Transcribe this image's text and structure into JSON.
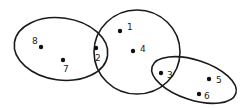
{
  "diagram": {
    "type": "set-clusters",
    "colors": {
      "stroke": "#1a1a1a",
      "dot": "#111111",
      "text": "#222222",
      "background": "#ffffff"
    },
    "sets": [
      {
        "id": "left",
        "cx": 61,
        "cy": 49,
        "rx": 47,
        "ry": 31,
        "rotate": 8,
        "members": [
          "8",
          "7",
          "2"
        ]
      },
      {
        "id": "middle",
        "cx": 137,
        "cy": 52,
        "rx": 43,
        "ry": 42,
        "rotate": 0,
        "members": [
          "2",
          "1",
          "4",
          "3"
        ]
      },
      {
        "id": "right",
        "cx": 194,
        "cy": 80,
        "rx": 44,
        "ry": 20,
        "rotate": 18,
        "members": [
          "3",
          "5",
          "6"
        ]
      }
    ],
    "points": [
      {
        "label": "8",
        "x": 41,
        "y": 47,
        "lx": 32,
        "ly": 44
      },
      {
        "label": "7",
        "x": 63,
        "y": 60,
        "lx": 63,
        "ly": 72
      },
      {
        "label": "2",
        "x": 96,
        "y": 48,
        "lx": 95,
        "ly": 61
      },
      {
        "label": "1",
        "x": 120,
        "y": 31,
        "lx": 127,
        "ly": 30
      },
      {
        "label": "4",
        "x": 133,
        "y": 51,
        "lx": 140,
        "ly": 52
      },
      {
        "label": "3",
        "x": 161,
        "y": 73,
        "lx": 167,
        "ly": 78
      },
      {
        "label": "5",
        "x": 209,
        "y": 79,
        "lx": 216,
        "ly": 83
      },
      {
        "label": "6",
        "x": 199,
        "y": 94,
        "lx": 204,
        "ly": 99
      }
    ]
  }
}
